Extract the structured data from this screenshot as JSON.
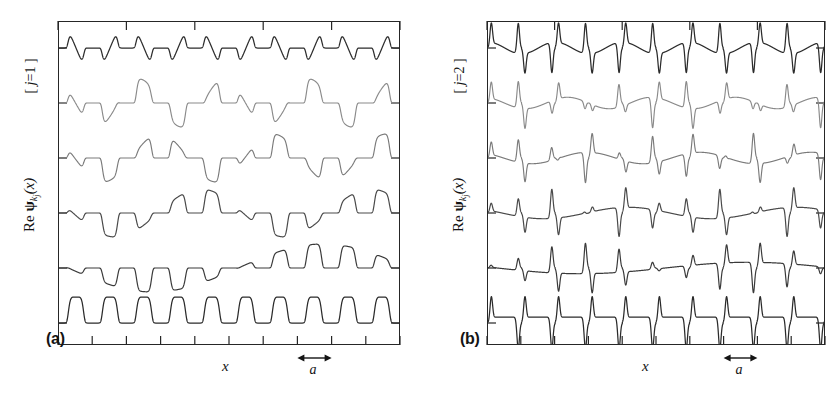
{
  "figure": {
    "caption_panels": [
      "(a)",
      "(b)"
    ],
    "x_axis_label": "x",
    "scale_label": "a",
    "y_axis_label_prefix": "Re",
    "y_axis_label_symbol": "ψ",
    "y_axis_label_sub_k": "k",
    "y_axis_label_sub_j": "j",
    "y_axis_label_arg": "(x)"
  },
  "panels": [
    {
      "id": "panel-a",
      "label": "(a)",
      "bracket_open": "[",
      "bracket_index_var": "j",
      "bracket_eq": "=",
      "bracket_index_value": "1",
      "bracket_close": "]",
      "x_label": "x",
      "scale_label": "a",
      "y_label": "Re ψk j(x)"
    },
    {
      "id": "panel-b",
      "label": "(b)",
      "bracket_open": "[",
      "bracket_index_var": "j",
      "bracket_eq": "=",
      "bracket_index_value": "2",
      "bracket_close": "]",
      "x_label": "x",
      "scale_label": "a",
      "y_label": "Re ψk j(x)"
    }
  ],
  "colors": {
    "frame": "#262626",
    "curve_dark": "#2b2b2b",
    "curve_mid": "#585858",
    "curve_light": "#8a8a8a",
    "background": "#ffffff"
  },
  "chart_data": {
    "type": "line",
    "title": "",
    "xlabel": "x",
    "ylabel": "Re ψ_{k_j}(x)",
    "grid": false,
    "legend": "none",
    "panels": [
      {
        "panel": "(a)",
        "band_index_j": 1,
        "n_traces": 6,
        "x_range_in_lattice_constants": [
          0,
          10
        ],
        "lattice_constant_a_ticks": 10,
        "axis": {
          "x_ticks": 11,
          "x_tick_spacing_a": 1,
          "top_ticks": 6,
          "y_baseline_ticks": 6,
          "tick_labels": []
        },
        "series": [
          {
            "name": "k = pi/a (zone boundary)",
            "trace_index": 0,
            "color": "#2b2b2b",
            "waveform": "flat-topped square-like, period 2a",
            "period_in_a": 2,
            "amplitude": 1.0
          },
          {
            "name": "k = 4pi/5a",
            "trace_index": 1,
            "color": "#8a8a8a",
            "waveform": "modulated bump train, beat period 5a",
            "period_in_a": 5,
            "amplitude": 0.85
          },
          {
            "name": "k = 3pi/5a",
            "trace_index": 2,
            "color": "#7a7a7a",
            "waveform": "modulated bump train, beat period 10a/3",
            "period_in_a": 3.3333,
            "amplitude": 0.85
          },
          {
            "name": "k = 2pi/5a",
            "trace_index": 3,
            "color": "#4a4a4a",
            "waveform": "modulated bump train, beat period 5a/2",
            "period_in_a": 2.5,
            "amplitude": 0.85
          },
          {
            "name": "k = pi/5a",
            "trace_index": 4,
            "color": "#3a3a3a",
            "waveform": "modulated bump train, beat period 2a",
            "period_in_a": 2,
            "amplitude": 0.85
          },
          {
            "name": "k = 0 (zone centre)",
            "trace_index": 5,
            "color": "#2b2b2b",
            "waveform": "uniform bump train, period a",
            "period_in_a": 1,
            "amplitude": 1.0
          }
        ]
      },
      {
        "panel": "(b)",
        "band_index_j": 2,
        "n_traces": 6,
        "x_range_in_lattice_constants": [
          0,
          10
        ],
        "lattice_constant_a_ticks": 10,
        "axis": {
          "x_ticks": 11,
          "x_tick_spacing_a": 1,
          "top_ticks": 6,
          "y_baseline_ticks": 6,
          "tick_labels": []
        },
        "series": [
          {
            "name": "k = pi/a (zone boundary)",
            "trace_index": 0,
            "color": "#2b2b2b",
            "waveform": "alternating sawtooth, period 2a",
            "period_in_a": 2,
            "amplitude": 1.0
          },
          {
            "name": "k = 4pi/5a",
            "trace_index": 1,
            "color": "#8a8a8a",
            "waveform": "modulated sawtooth, beat period 5a",
            "period_in_a": 5,
            "amplitude": 0.9
          },
          {
            "name": "k = 3pi/5a",
            "trace_index": 2,
            "color": "#7a7a7a",
            "waveform": "modulated sawtooth, beat period 10a/3",
            "period_in_a": 3.3333,
            "amplitude": 0.9
          },
          {
            "name": "k = 2pi/5a",
            "trace_index": 3,
            "color": "#4a4a4a",
            "waveform": "modulated sawtooth, beat period 5a/2",
            "period_in_a": 2.5,
            "amplitude": 0.9
          },
          {
            "name": "k = pi/5a",
            "trace_index": 4,
            "color": "#3a3a3a",
            "waveform": "modulated sawtooth, beat period 2a",
            "period_in_a": 2,
            "amplitude": 0.9
          },
          {
            "name": "k = 0 (zone centre)",
            "trace_index": 5,
            "color": "#2b2b2b",
            "waveform": "uniform sawtooth, period a",
            "period_in_a": 1,
            "amplitude": 1.0
          }
        ]
      }
    ]
  },
  "geometry": {
    "panel_a_frame": {
      "left": 58,
      "top": 21,
      "width": 342,
      "height": 324
    },
    "panel_b_frame": {
      "left": 487,
      "top": 21,
      "width": 338,
      "height": 324
    },
    "baseline_ticks_y": [
      48,
      103,
      158,
      213,
      268,
      323
    ],
    "x_tick_count": 11
  }
}
